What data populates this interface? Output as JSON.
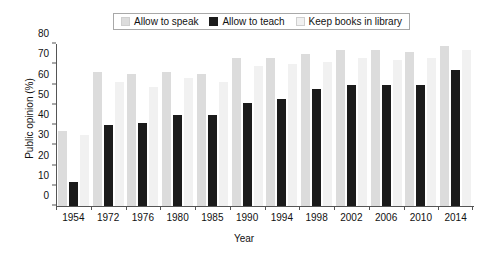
{
  "chart_data": {
    "type": "bar",
    "title": "",
    "xlabel": "Year",
    "ylabel": "Public opinion (%)",
    "ylim": [
      0,
      80
    ],
    "yticks": [
      0,
      10,
      20,
      30,
      40,
      50,
      60,
      70,
      80
    ],
    "grid": false,
    "legend_position": "top-center",
    "categories": [
      "1954",
      "1972",
      "1976",
      "1980",
      "1985",
      "1990",
      "1994",
      "1998",
      "2002",
      "2006",
      "2010",
      "2014"
    ],
    "series": [
      {
        "name": "Allow to speak",
        "color": "#dcdcdc",
        "values": [
          37,
          66,
          65,
          66,
          65,
          73,
          73,
          75,
          77,
          77,
          76,
          79
        ]
      },
      {
        "name": "Allow to teach",
        "color": "#1b1b1b",
        "values": [
          12,
          40,
          41,
          45,
          45,
          51,
          53,
          58,
          60,
          60,
          60,
          67
        ]
      },
      {
        "name": "Keep books in library",
        "color": "#f1f1f1",
        "values": [
          35,
          61,
          59,
          63,
          61,
          69,
          70,
          71,
          73,
          72,
          73,
          77
        ]
      }
    ]
  },
  "legend": {
    "entries": [
      {
        "label": "Allow to speak"
      },
      {
        "label": "Allow to teach"
      },
      {
        "label": "Keep books in library"
      }
    ]
  }
}
